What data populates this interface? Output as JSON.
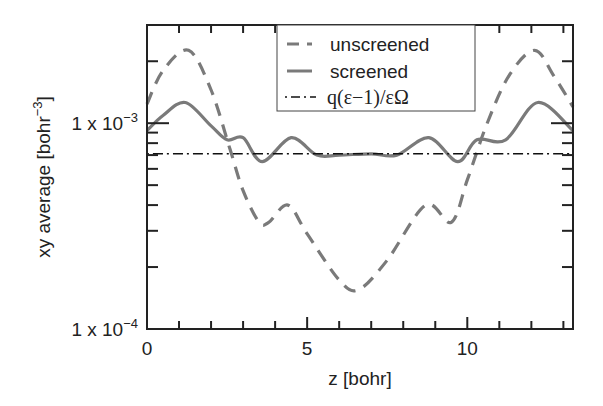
{
  "chart_data": {
    "type": "line",
    "title": "",
    "xlabel": "z [bohr]",
    "ylabel": "xy average [bohr^-3]",
    "ylabel_parts": {
      "main": "xy average [bohr",
      "sup": "−3",
      "close": "]"
    },
    "xlim": [
      0,
      13.3
    ],
    "ylim": [
      0.0001,
      0.003
    ],
    "yscale": "log",
    "grid": false,
    "legend_position": "upper center",
    "x_ticks": [
      {
        "value": 0,
        "label": "0"
      },
      {
        "value": 5,
        "label": "5"
      },
      {
        "value": 10,
        "label": "10"
      }
    ],
    "x_minor_ticks": [
      1,
      2,
      3,
      4,
      6,
      7,
      8,
      9,
      11,
      12,
      13
    ],
    "y_ticks": [
      {
        "value": 0.001,
        "label_base": "1 x 10",
        "label_exp": "−3"
      },
      {
        "value": 0.0001,
        "label_base": "1 x 10",
        "label_exp": "−4"
      }
    ],
    "y_minor_ticks": [
      0.0002,
      0.0003,
      0.0004,
      0.0005,
      0.0006,
      0.0007,
      0.0008,
      0.0009,
      0.002
    ],
    "series": [
      {
        "name": "unscreened",
        "style": "dashed",
        "color": "#7a7a7a",
        "x": [
          0,
          0.5,
          1.3,
          2.0,
          2.6,
          3.0,
          3.5,
          3.8,
          4.4,
          5.0,
          6.0,
          6.6,
          7.5,
          8.7,
          9.5,
          10.0,
          10.6,
          11.3,
          12.1,
          12.7,
          13.3
        ],
        "values": [
          0.00124,
          0.0018,
          0.00226,
          0.00145,
          0.00074,
          0.00047,
          0.00033,
          0.00033,
          0.0004,
          0.00029,
          0.000173,
          0.000155,
          0.000216,
          0.0004,
          0.00033,
          0.00053,
          0.00098,
          0.0017,
          0.00226,
          0.0017,
          0.0012
        ]
      },
      {
        "name": "screened",
        "style": "solid",
        "color": "#7a7a7a",
        "x": [
          0,
          0.5,
          1.2,
          2.0,
          2.5,
          3.0,
          3.6,
          4.5,
          5.3,
          6.0,
          7.0,
          7.8,
          8.8,
          9.7,
          10.3,
          11.2,
          12.2,
          13.3
        ],
        "values": [
          0.00092,
          0.00109,
          0.00126,
          0.00097,
          0.00083,
          0.00085,
          0.00065,
          0.00085,
          0.0007,
          0.0007,
          0.00071,
          0.0007,
          0.00085,
          0.00065,
          0.00083,
          0.00083,
          0.00126,
          0.00092
        ]
      },
      {
        "name": "q(ε−1)/εΩ",
        "style": "dashdot",
        "color": "#111111",
        "x": [
          0,
          13.3
        ],
        "values": [
          0.00071,
          0.00071
        ]
      }
    ]
  },
  "legend": {
    "items": [
      {
        "label": "unscreened"
      },
      {
        "label": "screened"
      },
      {
        "label": "q(ε−1)/εΩ"
      }
    ]
  }
}
